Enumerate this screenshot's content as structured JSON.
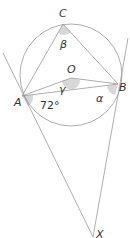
{
  "diagram": {
    "type": "circle-geometry",
    "points": {
      "A": {
        "label": "A",
        "x": 22,
        "y": 96
      },
      "B": {
        "label": "B",
        "x": 118,
        "y": 84
      },
      "C": {
        "label": "C",
        "x": 63,
        "y": 24
      },
      "O": {
        "label": "O",
        "x": 71,
        "y": 78
      },
      "X": {
        "label": "X",
        "x": 93,
        "y": 237
      }
    },
    "angles": {
      "beta": "β",
      "gamma": "γ",
      "alpha": "α",
      "given": "72°"
    },
    "colors": {
      "line": "#999999",
      "shade": "#d8d8d8",
      "text": "#333333"
    }
  }
}
